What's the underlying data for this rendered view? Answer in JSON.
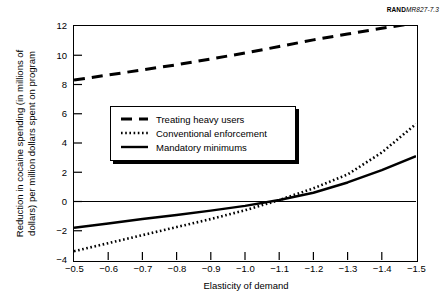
{
  "source_code": {
    "rand_mark": "RAND",
    "doc_num": "MR827-7.3"
  },
  "chart_data": {
    "type": "line",
    "title": "",
    "xlabel": "Elasticity of demand",
    "ylabel": "Reduction in cocaine spending (in millions of\ndollars) per million dollars spent on program",
    "xlim": [
      -0.5,
      -1.5
    ],
    "ylim": [
      -4,
      12
    ],
    "x_ticks": [
      "−0.5",
      "−0.6",
      "−0.7",
      "−0.8",
      "−0.9",
      "−1.0",
      "−1.1",
      "−1.2",
      "−1.3",
      "−1.4",
      "−1.5"
    ],
    "x_tick_values": [
      -0.5,
      -0.6,
      -0.7,
      -0.8,
      -0.9,
      -1.0,
      -1.1,
      -1.2,
      -1.3,
      -1.4,
      -1.5
    ],
    "y_ticks": [
      "12",
      "10",
      "8",
      "6",
      "4",
      "2",
      "0",
      "−2",
      "−4"
    ],
    "y_tick_values": [
      12,
      10,
      8,
      6,
      4,
      2,
      0,
      -2,
      -4
    ],
    "grid": false,
    "zero_line": true,
    "legend_position": "center-left",
    "x": [
      -0.5,
      -0.6,
      -0.7,
      -0.8,
      -0.9,
      -1.0,
      -1.1,
      -1.2,
      -1.3,
      -1.4,
      -1.5
    ],
    "series": [
      {
        "name": "Treating heavy users",
        "style": "dashed",
        "color": "#000000",
        "values": [
          8.3,
          8.65,
          9.0,
          9.35,
          9.75,
          10.15,
          10.6,
          11.05,
          11.45,
          11.85,
          12.2
        ]
      },
      {
        "name": "Conventional enforcement",
        "style": "dotted",
        "color": "#000000",
        "values": [
          -3.4,
          -2.85,
          -2.3,
          -1.75,
          -1.2,
          -0.6,
          0.1,
          0.9,
          1.85,
          3.35,
          5.3
        ]
      },
      {
        "name": "Mandatory minimums",
        "style": "solid",
        "color": "#000000",
        "values": [
          -1.8,
          -1.5,
          -1.2,
          -0.92,
          -0.62,
          -0.3,
          0.1,
          0.6,
          1.3,
          2.15,
          3.1
        ]
      }
    ]
  },
  "legend": {
    "entries": [
      {
        "label": "Treating heavy users",
        "style": "dashed"
      },
      {
        "label": "Conventional enforcement",
        "style": "dotted"
      },
      {
        "label": "Mandatory minimums",
        "style": "solid"
      }
    ]
  }
}
